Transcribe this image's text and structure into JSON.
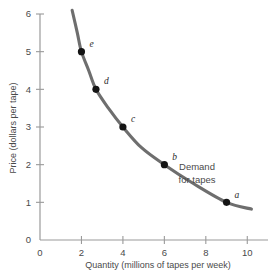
{
  "figure": {
    "name": "demand-for-tapes-graph",
    "background_color": "#ffffff"
  },
  "chart_data": {
    "type": "line",
    "title": "",
    "xlabel": "Quantity (millions of tapes per week)",
    "ylabel": "Price (dollars per tape)",
    "xlim": [
      0,
      11
    ],
    "ylim": [
      0,
      6
    ],
    "xticks": [
      "0",
      "2",
      "4",
      "6",
      "8",
      "10"
    ],
    "xtick_values": [
      0,
      2,
      4,
      6,
      8,
      10
    ],
    "yticks": [
      "0",
      "1",
      "2",
      "3",
      "4",
      "5",
      "6"
    ],
    "ytick_values": [
      0,
      1,
      2,
      3,
      4,
      5,
      6
    ],
    "grid": false,
    "legend": "none",
    "series": [
      {
        "name": "Demand for tapes",
        "curve_color": "#6e6e6e",
        "x": [
          1.55,
          1.8,
          2.0,
          2.35,
          2.7,
          3.3,
          4.0,
          4.9,
          6.0,
          7.4,
          9.0,
          10.2
        ],
        "y": [
          6.1,
          5.5,
          5.0,
          4.5,
          4.0,
          3.5,
          3.0,
          2.45,
          2.0,
          1.5,
          1.0,
          0.82
        ]
      }
    ],
    "points": [
      {
        "label": "a",
        "x": 9.0,
        "y": 1.0,
        "label_dx": 8,
        "label_dy": -4
      },
      {
        "label": "b",
        "x": 6.0,
        "y": 2.0,
        "label_dx": 8,
        "label_dy": -5
      },
      {
        "label": "c",
        "x": 4.0,
        "y": 3.0,
        "label_dx": 8,
        "label_dy": -5
      },
      {
        "label": "d",
        "x": 2.7,
        "y": 4.0,
        "label_dx": 8,
        "label_dy": -5
      },
      {
        "label": "e",
        "x": 2.0,
        "y": 5.0,
        "label_dx": 8,
        "label_dy": -5
      }
    ],
    "annotations": [
      {
        "name": "demand-curve-note",
        "line1": "Demand",
        "line2": "for tapes"
      }
    ]
  }
}
